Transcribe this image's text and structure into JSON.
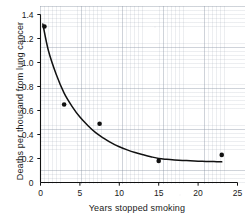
{
  "figure": {
    "type": "scatter-with-fitted-curve",
    "caption_remnant": "",
    "ink_color": "#1a1a1a",
    "background_color": "#ffffff",
    "grid_color": "#8c96a5"
  },
  "chart_data": {
    "type": "scatter",
    "title": "",
    "xlabel": "Years stopped smoking",
    "ylabel": "Deaths per thousand from lung cancer",
    "xlim": [
      0,
      25
    ],
    "ylim": [
      0,
      1.4
    ],
    "grid": true,
    "grid_style": "faint graph paper",
    "legend": null,
    "xticks": [
      0,
      5,
      10,
      15,
      20,
      25
    ],
    "xtick_labels": [
      "0",
      "5",
      "10",
      "15",
      "20",
      "25"
    ],
    "yticks": [
      0,
      0.2,
      0.4,
      0.6,
      0.8,
      1.0,
      1.2,
      1.4
    ],
    "ytick_labels": [
      "0",
      "0.2",
      "0.4",
      "0.6",
      "0.8",
      "1.0",
      "1.2",
      "1.4"
    ],
    "series": [
      {
        "name": "Observed death rate",
        "marker": "filled circle",
        "color": "#111111",
        "x": [
          0.5,
          3.0,
          7.5,
          15.0,
          23.0
        ],
        "y": [
          1.3,
          0.65,
          0.49,
          0.18,
          0.23
        ]
      },
      {
        "name": "Fitted exponential decay curve",
        "marker": "none",
        "line": "solid",
        "color": "#111111",
        "x": [
          0.3,
          1.0,
          2.0,
          3.0,
          4.0,
          5.0,
          6.0,
          7.0,
          8.0,
          9.0,
          10.0,
          11.0,
          12.0,
          13.0,
          14.0,
          15.0,
          16.0,
          17.0,
          18.0,
          19.0,
          20.0,
          21.0,
          22.0,
          23.0
        ],
        "y": [
          1.32,
          1.1,
          0.9,
          0.745,
          0.635,
          0.545,
          0.475,
          0.415,
          0.37,
          0.33,
          0.298,
          0.272,
          0.25,
          0.232,
          0.215,
          0.2,
          0.193,
          0.188,
          0.184,
          0.181,
          0.178,
          0.176,
          0.174,
          0.172
        ]
      }
    ]
  }
}
